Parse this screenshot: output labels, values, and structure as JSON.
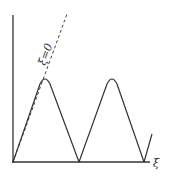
{
  "diagram": {
    "type": "sketch-plot",
    "x_axis_label": "ξ",
    "y_axis_label": "",
    "line_label": "ξ=0",
    "colors": {
      "stroke": "#333333",
      "background": "#ffffff"
    },
    "curve_points": [
      [
        13,
        162
      ],
      [
        45,
        78
      ],
      [
        79,
        162
      ],
      [
        112,
        78
      ],
      [
        144,
        162
      ],
      [
        152,
        134
      ]
    ],
    "dashed_line": {
      "from": [
        13,
        162
      ],
      "to": [
        67,
        14
      ]
    }
  }
}
